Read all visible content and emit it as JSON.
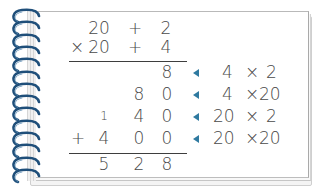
{
  "problem": {
    "multiplicand": {
      "tens": "20",
      "op": "+",
      "ones": "2"
    },
    "multiplier": {
      "sign": "×",
      "tens": "20",
      "op": "+",
      "ones": "4"
    }
  },
  "partial_products": [
    {
      "digits": [
        "",
        "",
        "8"
      ],
      "carry": "",
      "sign": "",
      "label_left": "4",
      "label_op": "×",
      "label_right": "2"
    },
    {
      "digits": [
        "",
        "8",
        "0"
      ],
      "carry": "",
      "sign": "",
      "label_left": "4",
      "label_op": "×",
      "label_right": "20"
    },
    {
      "digits": [
        "",
        "4",
        "0"
      ],
      "carry": "1",
      "sign": "",
      "label_left": "20",
      "label_op": "×",
      "label_right": "2"
    },
    {
      "digits": [
        "4",
        "0",
        "0"
      ],
      "carry": "",
      "sign": "+",
      "label_left": "20",
      "label_op": "×",
      "label_right": "20"
    }
  ],
  "result": {
    "digits": [
      "5",
      "2",
      "8"
    ]
  },
  "colors": {
    "ink": "#4a4a4a",
    "arrow": "#2f7aa0",
    "spiral": "#1f4f7a"
  }
}
